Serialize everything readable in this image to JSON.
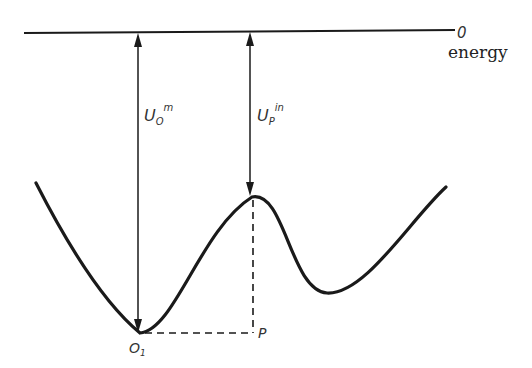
{
  "diagram": {
    "type": "potential-energy-curve",
    "zero_level": {
      "label": "0",
      "axis_label": "energy"
    },
    "arrows": [
      {
        "id": "u-o",
        "label_main": "U",
        "label_sub": "O",
        "label_sup": "m"
      },
      {
        "id": "u-p",
        "label_main": "U",
        "label_sub": "P",
        "label_sup": "in"
      }
    ],
    "points": [
      {
        "id": "o1",
        "label": "O",
        "label_sub": "1"
      },
      {
        "id": "p",
        "label": "P"
      }
    ],
    "colors": {
      "line": "#1a1a1a",
      "background": "#ffffff"
    }
  }
}
